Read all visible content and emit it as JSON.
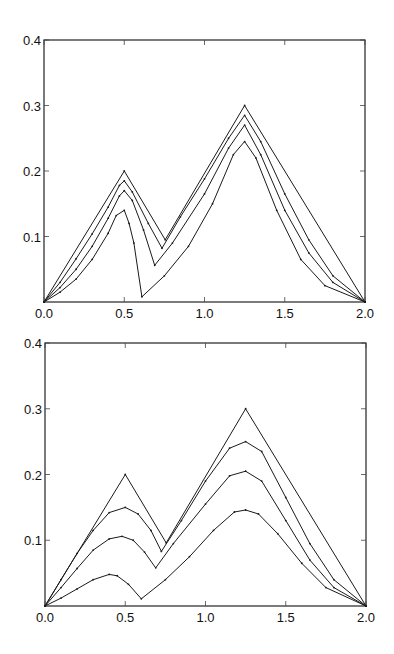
{
  "chart_data": [
    {
      "type": "line",
      "title": "",
      "xlabel": "",
      "ylabel": "",
      "xlim": [
        0.0,
        2.0
      ],
      "ylim": [
        0.0,
        0.4
      ],
      "xticks": [
        "0.0",
        "0.5",
        "1.0",
        "1.5",
        "2.0"
      ],
      "yticks": [
        "0.1",
        "0.2",
        "0.3",
        "0.4"
      ],
      "grid": false,
      "legend": null,
      "frame": {
        "x0": 44,
        "x1": 365,
        "y0": 302,
        "y1": 40
      },
      "series": [
        {
          "name": "curve-1",
          "points": [
            [
              0,
              0
            ],
            [
              0.5,
              0.2
            ],
            [
              0.755,
              0.095
            ],
            [
              1.25,
              0.3
            ],
            [
              2.0,
              0
            ]
          ]
        },
        {
          "name": "curve-2",
          "points": [
            [
              0,
              0
            ],
            [
              0.1,
              0.03
            ],
            [
              0.2,
              0.066
            ],
            [
              0.3,
              0.104
            ],
            [
              0.4,
              0.145
            ],
            [
              0.47,
              0.178
            ],
            [
              0.5,
              0.185
            ],
            [
              0.55,
              0.168
            ],
            [
              0.65,
              0.12
            ],
            [
              0.735,
              0.082
            ],
            [
              0.85,
              0.13
            ],
            [
              1.0,
              0.188
            ],
            [
              1.15,
              0.25
            ],
            [
              1.25,
              0.285
            ],
            [
              1.35,
              0.245
            ],
            [
              1.5,
              0.165
            ],
            [
              1.65,
              0.095
            ],
            [
              1.8,
              0.04
            ],
            [
              2.0,
              0
            ]
          ]
        },
        {
          "name": "curve-3",
          "points": [
            [
              0,
              0
            ],
            [
              0.1,
              0.022
            ],
            [
              0.2,
              0.05
            ],
            [
              0.3,
              0.085
            ],
            [
              0.4,
              0.128
            ],
            [
              0.47,
              0.162
            ],
            [
              0.5,
              0.17
            ],
            [
              0.55,
              0.155
            ],
            [
              0.62,
              0.11
            ],
            [
              0.69,
              0.056
            ],
            [
              0.8,
              0.09
            ],
            [
              1.0,
              0.165
            ],
            [
              1.15,
              0.235
            ],
            [
              1.25,
              0.27
            ],
            [
              1.35,
              0.225
            ],
            [
              1.5,
              0.14
            ],
            [
              1.65,
              0.075
            ],
            [
              1.8,
              0.03
            ],
            [
              2.0,
              0
            ]
          ]
        },
        {
          "name": "curve-4",
          "points": [
            [
              0,
              0
            ],
            [
              0.1,
              0.015
            ],
            [
              0.2,
              0.035
            ],
            [
              0.3,
              0.065
            ],
            [
              0.4,
              0.105
            ],
            [
              0.45,
              0.132
            ],
            [
              0.5,
              0.14
            ],
            [
              0.53,
              0.12
            ],
            [
              0.56,
              0.09
            ],
            [
              0.61,
              0.008
            ],
            [
              0.75,
              0.04
            ],
            [
              0.9,
              0.085
            ],
            [
              1.05,
              0.15
            ],
            [
              1.18,
              0.225
            ],
            [
              1.25,
              0.245
            ],
            [
              1.32,
              0.22
            ],
            [
              1.45,
              0.14
            ],
            [
              1.6,
              0.065
            ],
            [
              1.75,
              0.025
            ],
            [
              2.0,
              0
            ]
          ]
        }
      ]
    },
    {
      "type": "line",
      "title": "",
      "xlabel": "",
      "ylabel": "",
      "xlim": [
        0.0,
        2.0
      ],
      "ylim": [
        0.0,
        0.4
      ],
      "xticks": [
        "0.0",
        "0.5",
        "1.0",
        "1.5",
        "2.0"
      ],
      "yticks": [
        "0.1",
        "0.2",
        "0.3",
        "0.4"
      ],
      "grid": false,
      "legend": null,
      "frame": {
        "x0": 45,
        "x1": 366,
        "y0": 606,
        "y1": 343
      },
      "series": [
        {
          "name": "curve-1",
          "points": [
            [
              0,
              0
            ],
            [
              0.5,
              0.2
            ],
            [
              0.755,
              0.096
            ],
            [
              1.25,
              0.3
            ],
            [
              2.0,
              0
            ]
          ]
        },
        {
          "name": "curve-2",
          "points": [
            [
              0,
              0
            ],
            [
              0.1,
              0.04
            ],
            [
              0.2,
              0.08
            ],
            [
              0.3,
              0.115
            ],
            [
              0.4,
              0.142
            ],
            [
              0.5,
              0.15
            ],
            [
              0.58,
              0.14
            ],
            [
              0.66,
              0.115
            ],
            [
              0.725,
              0.083
            ],
            [
              0.85,
              0.13
            ],
            [
              1.0,
              0.19
            ],
            [
              1.15,
              0.24
            ],
            [
              1.25,
              0.25
            ],
            [
              1.35,
              0.235
            ],
            [
              1.5,
              0.165
            ],
            [
              1.65,
              0.095
            ],
            [
              1.8,
              0.04
            ],
            [
              2.0,
              0
            ]
          ]
        },
        {
          "name": "curve-3",
          "points": [
            [
              0,
              0
            ],
            [
              0.1,
              0.028
            ],
            [
              0.2,
              0.057
            ],
            [
              0.3,
              0.085
            ],
            [
              0.4,
              0.102
            ],
            [
              0.48,
              0.106
            ],
            [
              0.55,
              0.1
            ],
            [
              0.62,
              0.082
            ],
            [
              0.69,
              0.058
            ],
            [
              0.8,
              0.095
            ],
            [
              1.0,
              0.155
            ],
            [
              1.15,
              0.198
            ],
            [
              1.25,
              0.205
            ],
            [
              1.35,
              0.19
            ],
            [
              1.5,
              0.13
            ],
            [
              1.65,
              0.07
            ],
            [
              1.8,
              0.028
            ],
            [
              2.0,
              0
            ]
          ]
        },
        {
          "name": "curve-4",
          "points": [
            [
              0,
              0
            ],
            [
              0.1,
              0.012
            ],
            [
              0.2,
              0.026
            ],
            [
              0.3,
              0.04
            ],
            [
              0.4,
              0.048
            ],
            [
              0.45,
              0.046
            ],
            [
              0.52,
              0.033
            ],
            [
              0.6,
              0.011
            ],
            [
              0.75,
              0.04
            ],
            [
              0.9,
              0.075
            ],
            [
              1.05,
              0.115
            ],
            [
              1.18,
              0.143
            ],
            [
              1.25,
              0.146
            ],
            [
              1.33,
              0.14
            ],
            [
              1.45,
              0.11
            ],
            [
              1.6,
              0.065
            ],
            [
              1.75,
              0.028
            ],
            [
              2.0,
              0
            ]
          ]
        }
      ]
    }
  ]
}
